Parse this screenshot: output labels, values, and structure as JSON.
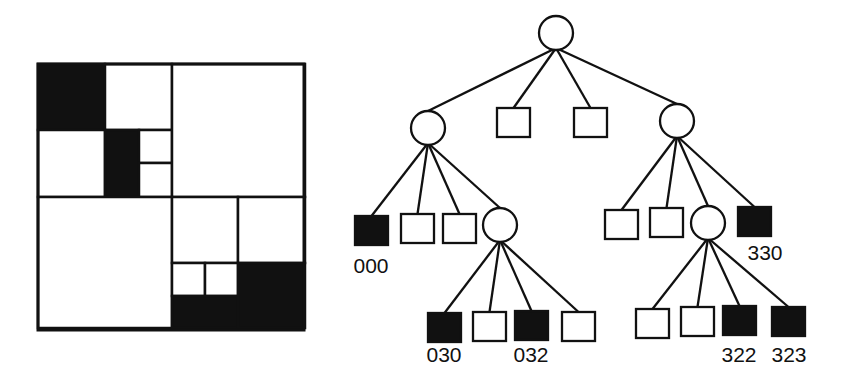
{
  "diagram": {
    "type": "quadtree",
    "colors": {
      "stroke": "#111111",
      "filled": "#111111",
      "empty": "#ffffff"
    },
    "region": {
      "x": 38,
      "y": 64,
      "size": 266,
      "cells": [
        {
          "x": 38,
          "y": 64,
          "w": 67,
          "h": 66,
          "filled": true
        },
        {
          "x": 105,
          "y": 64,
          "w": 67,
          "h": 66,
          "filled": false
        },
        {
          "x": 38,
          "y": 130,
          "w": 67,
          "h": 67,
          "filled": false
        },
        {
          "x": 105,
          "y": 130,
          "w": 34,
          "h": 67,
          "filled": true
        },
        {
          "x": 139,
          "y": 130,
          "w": 33,
          "h": 33,
          "filled": false
        },
        {
          "x": 139,
          "y": 163,
          "w": 33,
          "h": 34,
          "filled": false
        },
        {
          "x": 172,
          "y": 64,
          "w": 133,
          "h": 133,
          "filled": false
        },
        {
          "x": 38,
          "y": 197,
          "w": 134,
          "h": 131,
          "filled": false
        },
        {
          "x": 172,
          "y": 197,
          "w": 66,
          "h": 66,
          "filled": false
        },
        {
          "x": 238,
          "y": 197,
          "w": 67,
          "h": 66,
          "filled": false
        },
        {
          "x": 172,
          "y": 263,
          "w": 33,
          "h": 33,
          "filled": false
        },
        {
          "x": 205,
          "y": 263,
          "w": 33,
          "h": 33,
          "filled": false
        },
        {
          "x": 172,
          "y": 296,
          "w": 66,
          "h": 32,
          "filled": true
        },
        {
          "x": 238,
          "y": 263,
          "w": 67,
          "h": 65,
          "filled": true
        }
      ]
    },
    "tree": {
      "nodes": [
        {
          "id": "root",
          "kind": "internal",
          "cx": 556,
          "cy": 33
        },
        {
          "id": "0",
          "kind": "internal",
          "cx": 428,
          "cy": 128
        },
        {
          "id": "1",
          "kind": "leaf",
          "filled": false,
          "x": 497,
          "y": 108
        },
        {
          "id": "2",
          "kind": "leaf",
          "filled": false,
          "x": 574,
          "y": 108
        },
        {
          "id": "3",
          "kind": "internal",
          "cx": 677,
          "cy": 121
        },
        {
          "id": "000",
          "kind": "leaf",
          "filled": true,
          "x": 355,
          "y": 216,
          "label": "000"
        },
        {
          "id": "001",
          "kind": "leaf",
          "filled": false,
          "x": 401,
          "y": 214
        },
        {
          "id": "002",
          "kind": "leaf",
          "filled": false,
          "x": 443,
          "y": 214
        },
        {
          "id": "03",
          "kind": "internal",
          "cx": 500,
          "cy": 225
        },
        {
          "id": "030",
          "kind": "leaf",
          "filled": true,
          "x": 428,
          "y": 313,
          "label": "030"
        },
        {
          "id": "031",
          "kind": "leaf",
          "filled": false,
          "x": 473,
          "y": 312
        },
        {
          "id": "032",
          "kind": "leaf",
          "filled": true,
          "x": 515,
          "y": 311,
          "label": "032"
        },
        {
          "id": "033",
          "kind": "leaf",
          "filled": false,
          "x": 562,
          "y": 312
        },
        {
          "id": "30",
          "kind": "leaf",
          "filled": false,
          "x": 605,
          "y": 210
        },
        {
          "id": "31",
          "kind": "leaf",
          "filled": false,
          "x": 650,
          "y": 208
        },
        {
          "id": "32",
          "kind": "internal",
          "cx": 708,
          "cy": 223
        },
        {
          "id": "330",
          "kind": "leaf",
          "filled": true,
          "x": 738,
          "y": 207,
          "label": "330"
        },
        {
          "id": "320",
          "kind": "leaf",
          "filled": false,
          "x": 636,
          "y": 309
        },
        {
          "id": "321",
          "kind": "leaf",
          "filled": false,
          "x": 681,
          "y": 307
        },
        {
          "id": "322",
          "kind": "leaf",
          "filled": true,
          "x": 723,
          "y": 306,
          "label": "322"
        },
        {
          "id": "323",
          "kind": "leaf",
          "filled": true,
          "x": 772,
          "y": 307,
          "label": "323"
        }
      ],
      "edges": [
        [
          "root",
          "0"
        ],
        [
          "root",
          "1"
        ],
        [
          "root",
          "2"
        ],
        [
          "root",
          "3"
        ],
        [
          "0",
          "000"
        ],
        [
          "0",
          "001"
        ],
        [
          "0",
          "002"
        ],
        [
          "0",
          "03"
        ],
        [
          "03",
          "030"
        ],
        [
          "03",
          "031"
        ],
        [
          "03",
          "032"
        ],
        [
          "03",
          "033"
        ],
        [
          "3",
          "30"
        ],
        [
          "3",
          "31"
        ],
        [
          "3",
          "32"
        ],
        [
          "3",
          "330"
        ],
        [
          "32",
          "320"
        ],
        [
          "32",
          "321"
        ],
        [
          "32",
          "322"
        ],
        [
          "32",
          "323"
        ]
      ],
      "leaf_size": 33,
      "circle_radius": 17
    },
    "labels": [
      {
        "text": "000",
        "x": 371,
        "y": 273
      },
      {
        "text": "030",
        "x": 444,
        "y": 362
      },
      {
        "text": "032",
        "x": 531,
        "y": 362
      },
      {
        "text": "330",
        "x": 765,
        "y": 260
      },
      {
        "text": "322",
        "x": 739,
        "y": 362
      },
      {
        "text": "323",
        "x": 789,
        "y": 362
      }
    ]
  }
}
